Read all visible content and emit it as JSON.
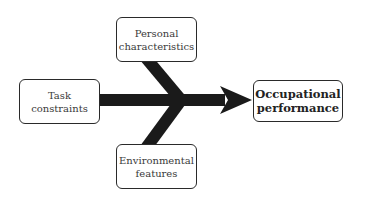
{
  "diagram": {
    "type": "fishbone-arrow",
    "inputs": [
      {
        "id": "personal",
        "lines": [
          "Personal",
          "characteristics"
        ]
      },
      {
        "id": "task",
        "lines": [
          "Task",
          "constraints"
        ]
      },
      {
        "id": "environment",
        "lines": [
          "Environmental",
          "features"
        ]
      }
    ],
    "outcome": {
      "id": "occupational",
      "lines": [
        "Occupational",
        "performance"
      ]
    },
    "colors": {
      "arrow": "#1a1a1a",
      "box_border": "#2a2a2a",
      "text": "#3a3a3a",
      "background": "#ffffff"
    }
  }
}
